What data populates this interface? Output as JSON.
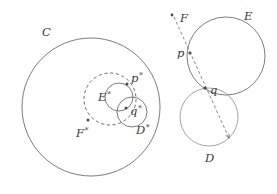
{
  "figure": {
    "background_color": "#ffffff",
    "stroke_color": "#5a5a5a",
    "light_stroke_color": "#8d8d8d",
    "point_color": "#4a4a4a",
    "label_color": "#3a3a3a"
  },
  "left_panel": {
    "name": "inverted-configuration",
    "labels": {
      "C": "C",
      "E_star_base": "E",
      "E_star_mark": "*",
      "F_star_base": "F",
      "F_star_mark": "*",
      "D_star_base": "D",
      "D_star_mark": "*",
      "p_star_base": "p",
      "p_star_mark": "*",
      "q_star_base": "q",
      "q_star_mark": "*"
    },
    "shapes": [
      {
        "name": "circle-C",
        "type": "circle",
        "style": "solid",
        "cx": 91,
        "cy": 107,
        "r": 69
      },
      {
        "name": "circle-F-star",
        "type": "circle",
        "style": "dashed",
        "cx": 110,
        "cy": 99,
        "r": 26
      },
      {
        "name": "circle-E-star",
        "type": "circle",
        "style": "solid",
        "cx": 119,
        "cy": 97,
        "r": 14
      },
      {
        "name": "circle-D-star",
        "type": "circle",
        "style": "solid",
        "cx": 132,
        "cy": 112,
        "r": 15
      }
    ],
    "points": [
      {
        "name": "point-p-star",
        "x": 127,
        "y": 84
      },
      {
        "name": "point-q-star",
        "x": 126,
        "y": 108
      },
      {
        "name": "point-F-star-center",
        "x": 88,
        "y": 120
      }
    ]
  },
  "right_panel": {
    "name": "original-configuration",
    "labels": {
      "F": "F",
      "E": "E",
      "D": "D",
      "p": "p",
      "q": "q"
    },
    "shapes": [
      {
        "name": "circle-E",
        "type": "circle",
        "style": "solid",
        "cx": 226,
        "cy": 56,
        "r": 39
      },
      {
        "name": "circle-D",
        "type": "circle",
        "style": "solid-light",
        "cx": 209,
        "cy": 117,
        "r": 29
      }
    ],
    "ray": {
      "name": "dashed-ray-F-to-D",
      "from_x": 174,
      "from_y": 17,
      "to_x": 229,
      "to_y": 138,
      "arrowhead": true
    },
    "points": [
      {
        "name": "point-F",
        "x": 172,
        "y": 15
      },
      {
        "name": "point-p",
        "x": 190,
        "y": 53
      },
      {
        "name": "point-q",
        "x": 205,
        "y": 88
      }
    ]
  }
}
